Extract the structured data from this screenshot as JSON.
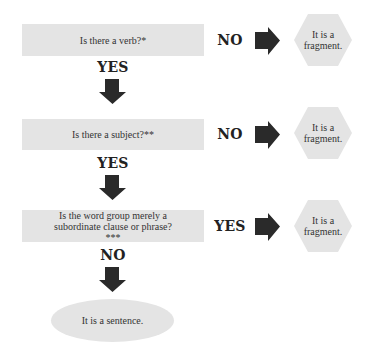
{
  "flowchart": {
    "steps": [
      {
        "question": "Is there a verb?*",
        "side_label": "NO",
        "side_result": "It is a fragment.",
        "down_label": "YES"
      },
      {
        "question": "Is there a subject?**",
        "side_label": "NO",
        "side_result": "It is a fragment.",
        "down_label": "YES"
      },
      {
        "question": "Is the word group merely a subordinate clause or phrase?***",
        "side_label": "YES",
        "side_result": "It is a fragment.",
        "down_label": "NO"
      }
    ],
    "final_result": "It is a sentence."
  },
  "colors": {
    "box_fill": "#e4e4e4",
    "arrow_fill": "#2a2a2a",
    "text": "#222222"
  }
}
